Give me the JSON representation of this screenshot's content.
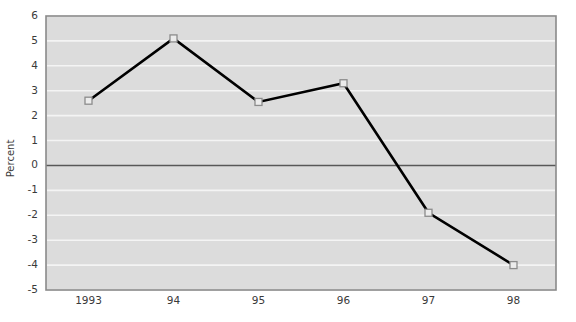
{
  "chart_data": {
    "type": "line",
    "title": "",
    "xlabel": "",
    "ylabel": "Percent",
    "categories": [
      "1993",
      "94",
      "95",
      "96",
      "97",
      "98"
    ],
    "values": [
      2.6,
      5.1,
      2.55,
      3.3,
      -1.9,
      -4.0
    ],
    "series": [
      {
        "name": "Percent",
        "values": [
          2.6,
          5.1,
          2.55,
          3.3,
          -1.9,
          -4.0
        ]
      }
    ],
    "ylim": [
      -5,
      6
    ],
    "ytick_labels": [
      "6",
      "5",
      "4",
      "3",
      "2",
      "1",
      "0",
      "-1",
      "-2",
      "-3",
      "-4",
      "-5"
    ],
    "ytick_values": [
      6,
      5,
      4,
      3,
      2,
      1,
      0,
      -1,
      -2,
      -3,
      -4,
      -5
    ],
    "grid": true,
    "grid_color": "#f4f4f4",
    "zero_line": 0,
    "zero_line_color": "#585858",
    "legend": "none",
    "plot_background": "#dcdcdc",
    "line_color": "#000000",
    "marker_shape": "square",
    "marker_face_color": "#ececec",
    "marker_edge_color": "#8c8c8c",
    "axis_border_color": "#8a8a8a"
  }
}
